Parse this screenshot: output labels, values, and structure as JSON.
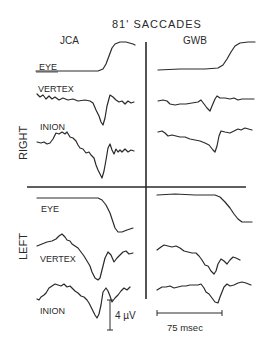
{
  "title": "81' SACCADES",
  "subjects": [
    "JCA",
    "GWB"
  ],
  "conditions": [
    "RIGHT",
    "LEFT"
  ],
  "channels": {
    "right": [
      "EYE",
      "VERTEX",
      "INION"
    ],
    "left": [
      "EYE",
      "VERTEX",
      "INION"
    ]
  },
  "scale_bars": {
    "amplitude": "4 µV",
    "time": "75 msec"
  }
}
